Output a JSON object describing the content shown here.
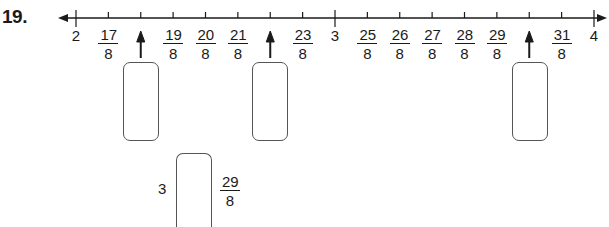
{
  "question": {
    "number": "19."
  },
  "number_line": {
    "start": 2,
    "end": 4,
    "step_denominator": 8,
    "labels": [
      {
        "type": "whole",
        "text": "2",
        "value": 2
      },
      {
        "type": "frac",
        "num": "17",
        "den": "8",
        "value": 2.125
      },
      {
        "type": "arrow",
        "value": 2.25
      },
      {
        "type": "frac",
        "num": "19",
        "den": "8",
        "value": 2.375
      },
      {
        "type": "frac",
        "num": "20",
        "den": "8",
        "value": 2.5
      },
      {
        "type": "frac",
        "num": "21",
        "den": "8",
        "value": 2.625
      },
      {
        "type": "arrow",
        "value": 2.75
      },
      {
        "type": "frac",
        "num": "23",
        "den": "8",
        "value": 2.875
      },
      {
        "type": "whole",
        "text": "3",
        "value": 3
      },
      {
        "type": "frac",
        "num": "25",
        "den": "8",
        "value": 3.125
      },
      {
        "type": "frac",
        "num": "26",
        "den": "8",
        "value": 3.25
      },
      {
        "type": "frac",
        "num": "27",
        "den": "8",
        "value": 3.375
      },
      {
        "type": "frac",
        "num": "28",
        "den": "8",
        "value": 3.5
      },
      {
        "type": "frac",
        "num": "29",
        "den": "8",
        "value": 3.625
      },
      {
        "type": "arrow",
        "value": 3.75
      },
      {
        "type": "frac",
        "num": "31",
        "den": "8",
        "value": 3.875
      },
      {
        "type": "whole",
        "text": "4",
        "value": 4
      }
    ]
  },
  "answer_boxes": [
    {
      "for_value": "18/8",
      "content": ""
    },
    {
      "for_value": "22/8",
      "content": ""
    },
    {
      "for_value": "30/8",
      "content": ""
    }
  ],
  "comparison": {
    "left": "3",
    "box": "",
    "right_num": "29",
    "right_den": "8"
  }
}
